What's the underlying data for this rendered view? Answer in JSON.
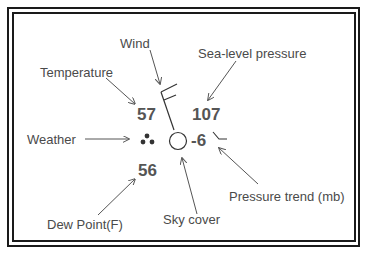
{
  "labels": {
    "wind": "Wind",
    "temperature": "Temperature",
    "sea_level_pressure": "Sea-level pressure",
    "weather": "Weather",
    "pressure_trend": "Pressure trend (mb)",
    "dew_point": "Dew Point(F)",
    "sky_cover": "Sky cover"
  },
  "values": {
    "temperature": "57",
    "sea_level_pressure": "107",
    "pressure_trend": "-6",
    "dew_point": "56"
  },
  "symbols": {
    "weather": "three-dots-rain-icon",
    "sky_cover": "empty-circle-clear-sky-icon",
    "wind": "wind-barb-two-full-barbs-icon",
    "pressure_trend": "falling-then-steady-trend-icon"
  },
  "colors": {
    "border": "#1a1a1a",
    "text": "#4a4a4a",
    "values": "#555555",
    "arrows": "#555555",
    "symbols": "#333333"
  }
}
